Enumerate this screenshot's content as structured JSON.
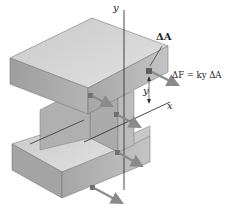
{
  "figure": {
    "type": "engineering-diagram",
    "labels": {
      "y_axis_top": "y",
      "x_axis": "x",
      "y_distance": "y",
      "area_element": "ΔA",
      "force_equation": "ΔF = ky ΔA"
    },
    "colors": {
      "top_face": "#d4d4d4",
      "front_face": "#a9a9a9",
      "side_face": "#bdbdbd",
      "web_face": "#b3b3b3",
      "edge": "#6e6e6e",
      "axis_line": "#333333",
      "arrow": "#8a8a8a",
      "text": "#222222"
    }
  }
}
